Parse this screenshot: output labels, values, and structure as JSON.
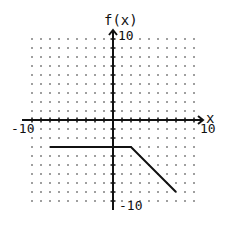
{
  "chart_data": {
    "type": "line",
    "title": "",
    "xlabel": "x",
    "ylabel": "f(x)",
    "xlim": [
      -10,
      10
    ],
    "ylim": [
      -10,
      10
    ],
    "grid": "dotted",
    "tick_labels": {
      "x_min": "-10",
      "x_max": "10",
      "y_min": "-10",
      "y_max": "10"
    },
    "series": [
      {
        "name": "f(x)",
        "x": [
          -7,
          2,
          7
        ],
        "y": [
          -3,
          -3,
          -8
        ]
      }
    ]
  },
  "colors": {
    "line": "#111111",
    "axis": "#111111",
    "grid_dot": "#555555",
    "background": "#ffffff"
  },
  "layout": {
    "origin_px": [
      113,
      120
    ],
    "unit_px": 9
  }
}
